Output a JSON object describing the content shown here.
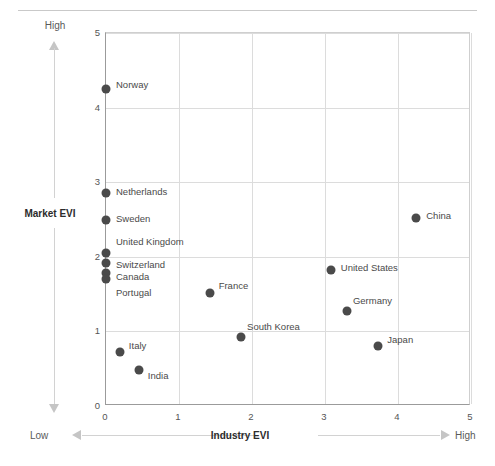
{
  "chart_data": {
    "type": "scatter",
    "title": "",
    "xlabel": "Industry EVI",
    "ylabel": "Market EVI",
    "xlim": [
      0,
      5
    ],
    "ylim": [
      0,
      5
    ],
    "xticks": [
      "0",
      "1",
      "2",
      "3",
      "4",
      "5"
    ],
    "yticks": [
      "0",
      "1",
      "2",
      "3",
      "4",
      "5"
    ],
    "grid": true,
    "legend": "none",
    "x_axis_low_label": "Low",
    "x_axis_high_label": "High",
    "y_axis_low_label": "Low",
    "y_axis_high_label": "High",
    "point_color": "#4a4a4a",
    "points": [
      {
        "label": "Norway",
        "x": 0.0,
        "y": 4.25,
        "label_dx": 10,
        "label_dy": -5
      },
      {
        "label": "Netherlands",
        "x": 0.0,
        "y": 2.85,
        "label_dx": 10,
        "label_dy": -2
      },
      {
        "label": "Sweden",
        "x": 0.0,
        "y": 2.5,
        "label_dx": 10,
        "label_dy": -2
      },
      {
        "label": "United Kingdom",
        "x": 0.0,
        "y": 2.05,
        "label_dx": 10,
        "label_dy": -12
      },
      {
        "label": "Switzerland",
        "x": 0.0,
        "y": 1.92,
        "label_dx": 10,
        "label_dy": 1
      },
      {
        "label": "Canada",
        "x": 0.0,
        "y": 1.78,
        "label_dx": 10,
        "label_dy": 3
      },
      {
        "label": "Portugal",
        "x": 0.0,
        "y": 1.7,
        "label_dx": 10,
        "label_dy": 13
      },
      {
        "label": "Italy",
        "x": 0.19,
        "y": 0.72,
        "label_dx": 9,
        "label_dy": -7
      },
      {
        "label": "India",
        "x": 0.45,
        "y": 0.48,
        "label_dx": 9,
        "label_dy": 5
      },
      {
        "label": "France",
        "x": 1.42,
        "y": 1.52,
        "label_dx": 9,
        "label_dy": -8
      },
      {
        "label": "South Korea",
        "x": 1.85,
        "y": 0.92,
        "label_dx": 6,
        "label_dy": -11
      },
      {
        "label": "United States",
        "x": 3.08,
        "y": 1.82,
        "label_dx": 10,
        "label_dy": -3
      },
      {
        "label": "Germany",
        "x": 3.3,
        "y": 1.28,
        "label_dx": 6,
        "label_dy": -11
      },
      {
        "label": "Japan",
        "x": 3.73,
        "y": 0.8,
        "label_dx": 9,
        "label_dy": -7
      },
      {
        "label": "China",
        "x": 4.25,
        "y": 2.52,
        "label_dx": 10,
        "label_dy": -3
      }
    ]
  }
}
